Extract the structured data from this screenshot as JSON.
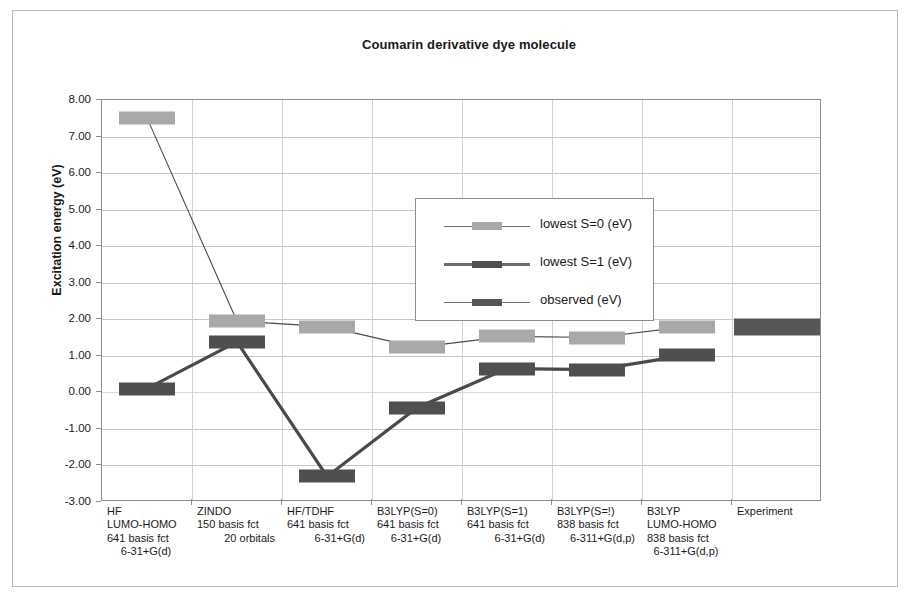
{
  "chart_data": {
    "type": "line",
    "title": "Coumarin derivative dye molecule",
    "xlabel": "",
    "ylabel": "Excitation energy (eV)",
    "ylim": [
      -3.0,
      8.0
    ],
    "ytick_step": 1.0,
    "ytick_labels": [
      "8.00",
      "7.00",
      "6.00",
      "5.00",
      "4.00",
      "3.00",
      "2.00",
      "1.00",
      "0.00",
      "-1.00",
      "-2.00",
      "-3.00"
    ],
    "ytick_values": [
      8,
      7,
      6,
      5,
      4,
      3,
      2,
      1,
      0,
      -1,
      -2,
      -3
    ],
    "grid": true,
    "legend_position": "inside-top-center",
    "categories": [
      "HF\nLUMO-HOMO\n641 basis fct\n6-31+G(d)",
      "ZINDO\n150 basis fct\n20 orbitals",
      "HF/TDHF\n641 basis fct\n6-31+G(d)",
      "B3LYP(S=0)\n641 basis fct\n6-31+G(d)",
      "B3LYP(S=1)\n641 basis fct\n6-31+G(d)",
      "B3LYP(S=!)\n838 basis fct\n6-311+G(d,p)",
      "B3LYP\nLUMO-HOMO\n838 basis fct\n6-311+G(d,p)",
      "Experiment"
    ],
    "category_lines": [
      [
        "HF",
        "LUMO-HOMO",
        "641 basis fct",
        "6-31+G(d)"
      ],
      [
        "ZINDO",
        "150 basis fct",
        "20 orbitals"
      ],
      [
        "HF/TDHF",
        "641 basis fct",
        "6-31+G(d)"
      ],
      [
        "B3LYP(S=0)",
        "641 basis fct",
        "6-31+G(d)"
      ],
      [
        "B3LYP(S=1)",
        "641 basis fct",
        "6-31+G(d)"
      ],
      [
        "B3LYP(S=!)",
        "838 basis fct",
        "6-311+G(d,p)"
      ],
      [
        "B3LYP",
        "LUMO-HOMO",
        "838 basis fct",
        "6-311+G(d,p)"
      ],
      [
        "Experiment"
      ]
    ],
    "series": [
      {
        "name": "lowest S=0 (eV)",
        "color": "#a9a9a9",
        "values": [
          7.51,
          1.95,
          1.8,
          1.23,
          1.53,
          1.5,
          1.8,
          null
        ]
      },
      {
        "name": "lowest S=1 (eV)",
        "color": "#4f4f4f",
        "values": [
          0.1,
          1.38,
          -2.3,
          -0.42,
          0.65,
          0.62,
          1.02,
          null
        ]
      },
      {
        "name": "observed (eV)",
        "color": "#565656",
        "values": [
          null,
          null,
          null,
          null,
          null,
          null,
          null,
          1.78
        ]
      }
    ]
  },
  "legend": {
    "items": [
      {
        "label": "lowest S=0 (eV)",
        "color": "#a9a9a9"
      },
      {
        "label": "lowest S=1 (eV)",
        "color": "#4f4f4f"
      },
      {
        "label": "observed (eV)",
        "color": "#565656"
      }
    ]
  }
}
